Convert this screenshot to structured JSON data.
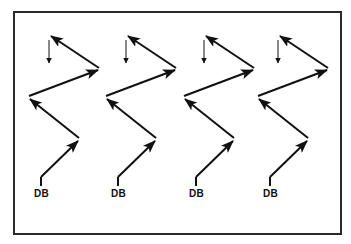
{
  "diagram": {
    "frame": {
      "border_color": "#2a2a2a"
    },
    "line_color": "#111111",
    "patterns": [
      {
        "label": "DB",
        "dx": 0
      },
      {
        "label": "DB",
        "dx": 77
      },
      {
        "label": "DB",
        "dx": 155
      },
      {
        "label": "DB",
        "dx": 229
      }
    ]
  }
}
